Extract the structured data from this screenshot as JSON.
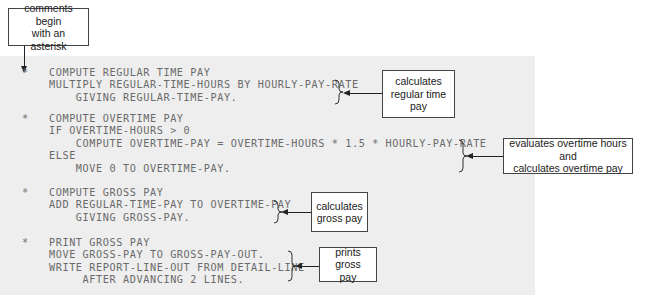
{
  "top_callout": {
    "text_line1": "comments begin",
    "text_line2": "with an asterisk"
  },
  "blocks": [
    {
      "lines": [
        "*   COMPUTE REGULAR TIME PAY",
        "    MULTIPLY REGULAR-TIME-HOURS BY HOURLY-PAY-RATE",
        "        GIVING REGULAR-TIME-PAY."
      ],
      "callout": {
        "line1": "calculates",
        "line2": "regular time",
        "line3": "pay"
      }
    },
    {
      "lines": [
        "*   COMPUTE OVERTIME PAY",
        "    IF OVERTIME-HOURS > 0",
        "        COMPUTE OVERTIME-PAY = OVERTIME-HOURS * 1.5 * HOURLY-PAY-RATE",
        "    ELSE",
        "        MOVE 0 TO OVERTIME-PAY."
      ],
      "callout": {
        "line1": "evaluates overtime hours and",
        "line2": "calculates overtime pay"
      }
    },
    {
      "lines": [
        "*   COMPUTE GROSS PAY",
        "    ADD REGULAR-TIME-PAY TO OVERTIME-PAY",
        "        GIVING GROSS-PAY."
      ],
      "callout": {
        "line1": "calculates",
        "line2": "gross pay"
      }
    },
    {
      "lines": [
        "*   PRINT GROSS PAY",
        "    MOVE GROSS-PAY TO GROSS-PAY-OUT.",
        "    WRITE REPORT-LINE-OUT FROM DETAIL-LINE",
        "         AFTER ADVANCING 2 LINES."
      ],
      "callout": {
        "line1": "prints gross",
        "line2": "pay"
      }
    }
  ],
  "colors": {
    "code_background": "#eeeeee",
    "code_text": "#6a6a6a",
    "callout_border": "#444444"
  }
}
